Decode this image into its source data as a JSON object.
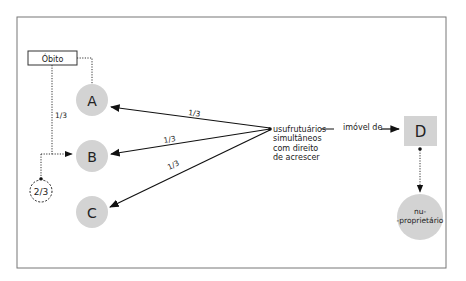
{
  "diagram": {
    "obito_box": {
      "label": "Óbito"
    },
    "nodes": {
      "A": {
        "label": "A"
      },
      "B": {
        "label": "B"
      },
      "C": {
        "label": "C"
      },
      "D": {
        "label": "D"
      },
      "nu_proprietario": {
        "line1": "nu-",
        "line2": "-proprietário"
      },
      "share_circle": {
        "label": "2/3"
      }
    },
    "edge_labels": {
      "obito_to_b": "1/3",
      "to_a": "1/3",
      "to_b": "1/3",
      "to_c": "1/3",
      "imovel": "imóvel de"
    },
    "hub_text": [
      "usufrutuários",
      "simultâneos",
      "com direito",
      "de acrescer"
    ],
    "colors": {
      "node_fill": "#d3d3d3",
      "stroke": "#222222",
      "frame": "#666666"
    }
  }
}
